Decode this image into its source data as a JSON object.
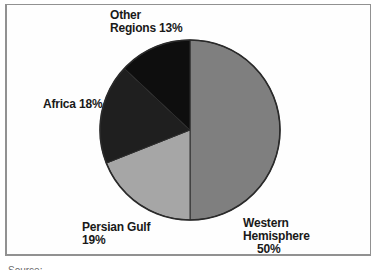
{
  "chart_data": {
    "type": "pie",
    "categories": [
      "Western Hemisphere",
      "Persian Gulf",
      "Africa",
      "Other Regions"
    ],
    "values": [
      50,
      19,
      18,
      13
    ],
    "unit": "%",
    "start_angle_deg": 0,
    "direction": "clockwise",
    "slices": [
      {
        "label": "Western Hemisphere",
        "value": 50,
        "color": "#7f7f7f"
      },
      {
        "label": "Persian Gulf",
        "value": 19,
        "color": "#a6a6a6"
      },
      {
        "label": "Africa",
        "value": 18,
        "color": "#1f1f1f"
      },
      {
        "label": "Other Regions",
        "value": 13,
        "color": "#0e0e0e"
      }
    ],
    "slice_stroke": "#2e2e2e",
    "outline_color": "#2a2a2a",
    "legend_position": "labels-around-pie",
    "grid": false,
    "title": ""
  },
  "labels": {
    "other": {
      "line1": "Other",
      "line2": "Regions 13%"
    },
    "africa": {
      "line1": "Africa 18%"
    },
    "persian_gulf": {
      "line1": "Persian Gulf",
      "line2": "19%"
    },
    "western": {
      "line1": "Western",
      "line2": "Hemisphere",
      "line3": "50%"
    }
  },
  "footer": {
    "source_caption_cutoff": "Source:"
  }
}
